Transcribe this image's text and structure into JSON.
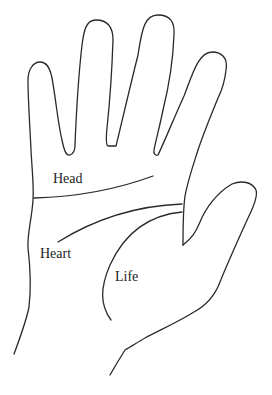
{
  "diagram": {
    "labels": {
      "head": "Head",
      "heart": "Heart",
      "life": "Life"
    },
    "colors": {
      "line": "#2a2a2a",
      "label": "#222222",
      "background": "#ffffff"
    }
  }
}
